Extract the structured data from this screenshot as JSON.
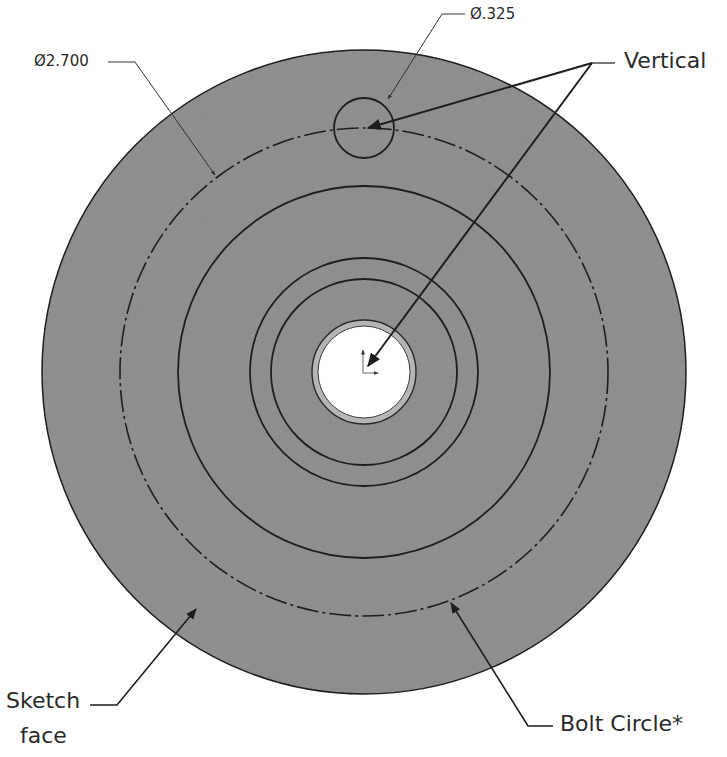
{
  "drawing": {
    "dimensions": {
      "outer_diameter": "Ø2.700",
      "hole_diameter": "Ø.325"
    },
    "callouts": {
      "vertical": "Vertical",
      "sketch_face_line1": "Sketch",
      "sketch_face_line2": "face",
      "bolt_circle": "Bolt Circle*"
    },
    "colors": {
      "face_fill": "#8a8a8a",
      "line": "#1e1e1e",
      "bore": "#ffffff",
      "bore_ring": "#b5b5b5"
    },
    "geometry": {
      "center": [
        364,
        372
      ],
      "outer_radius": 322,
      "bolt_circle_radius": 244,
      "concentric_radii": [
        186,
        114,
        93
      ],
      "bore_radius": 46,
      "bore_ring_radius": 52,
      "hole_center": [
        364,
        128
      ],
      "hole_radius": 30
    }
  }
}
